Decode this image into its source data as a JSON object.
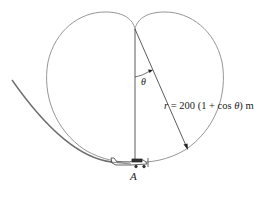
{
  "figure": {
    "curve_equation": {
      "lhs": "r",
      "equals": " = ",
      "rhs_prefix": "200 (1 + cos ",
      "rhs_var": "θ",
      "rhs_suffix": ") m"
    },
    "angle_label": "θ",
    "point_label": "A",
    "curve_type": "cardioid",
    "colors": {
      "curve": "#8a8a8a",
      "path": "#6e6e6e",
      "lines": "#333333",
      "text": "#222222"
    }
  }
}
